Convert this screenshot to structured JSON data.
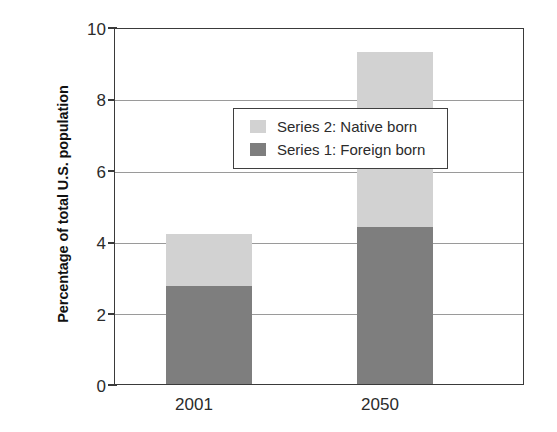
{
  "chart_data": {
    "type": "bar",
    "subtype": "stacked-bar",
    "title": "",
    "xlabel": "",
    "ylabel": "Percentage of total U.S. population",
    "categories": [
      "2001",
      "2050"
    ],
    "ylim": [
      0,
      10
    ],
    "yticks": [
      0,
      2,
      4,
      6,
      8,
      10
    ],
    "ytick_labels": [
      "0",
      "2",
      "4",
      "6",
      "8",
      "10"
    ],
    "grid": true,
    "grid_axis": "y",
    "legend_position": "upper left (inside plot area)",
    "series": [
      {
        "name": "Series 2: Native born",
        "color": "#d2d2d2",
        "values": [
          1.45,
          4.9
        ]
      },
      {
        "name": "Series 1: Foreign born",
        "color": "#7e7e7e",
        "values": [
          2.75,
          4.4
        ]
      }
    ],
    "stack_totals": [
      4.2,
      9.3
    ],
    "stack_order_bottom_to_top": [
      "Series 1: Foreign born",
      "Series 2: Native born"
    ]
  },
  "legend": {
    "items": [
      {
        "label": "Series 2: Native born",
        "color": "#d2d2d2"
      },
      {
        "label": "Series 1: Foreign born",
        "color": "#7e7e7e"
      }
    ]
  },
  "axes": {
    "y_title": "Percentage of total U.S. population",
    "y_tick_labels": [
      "10",
      "8",
      "6",
      "4",
      "2",
      "0"
    ],
    "x_tick_labels": [
      "2001",
      "2050"
    ]
  },
  "colors": {
    "native_born": "#d2d2d2",
    "foreign_born": "#7e7e7e",
    "axis": "#3a3a3a",
    "gridline": "#9a9a9a",
    "background": "#ffffff"
  }
}
